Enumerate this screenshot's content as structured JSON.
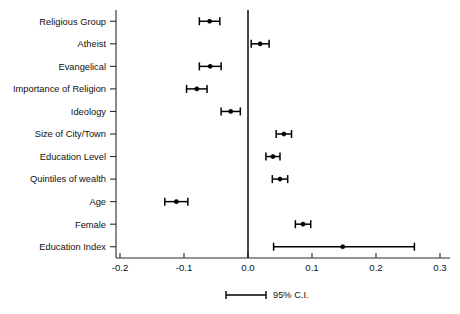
{
  "chart_data": {
    "type": "scatter",
    "title": "",
    "subtitle": "",
    "xlabel": "",
    "ylabel": "",
    "orientation": "horizontal",
    "xlim": [
      -0.2,
      0.3
    ],
    "xticks": [
      -0.2,
      -0.1,
      0.0,
      0.1,
      0.2,
      0.3
    ],
    "xticklabels": [
      "-0.2",
      "-0.1",
      "0.0",
      "0.1",
      "0.2",
      "0.3"
    ],
    "grid": false,
    "zero_reference_line": 0.0,
    "legend": {
      "position": "below-axis-center",
      "entries": [
        {
          "label": "95% C.I.",
          "marker": "error-bar"
        }
      ]
    },
    "categories": [
      "Religious Group",
      "Atheist",
      "Evangelical",
      "Importance of Religion",
      "Ideology",
      "Size of City/Town",
      "Education Level",
      "Quintiles of wealth",
      "Age",
      "Female",
      "Education Index"
    ],
    "values": [
      -0.06,
      0.019,
      -0.059,
      -0.08,
      -0.027,
      0.056,
      0.039,
      0.05,
      -0.112,
      0.086,
      0.148
    ],
    "ci_low": [
      -0.076,
      0.005,
      -0.076,
      -0.096,
      -0.042,
      0.044,
      0.028,
      0.038,
      -0.13,
      0.074,
      0.04
    ],
    "ci_high": [
      -0.044,
      0.033,
      -0.042,
      -0.064,
      -0.012,
      0.068,
      0.05,
      0.062,
      -0.094,
      0.098,
      0.26
    ],
    "points": [
      {
        "label": "Religious Group",
        "value": -0.06,
        "ci_low": -0.076,
        "ci_high": -0.044
      },
      {
        "label": "Atheist",
        "value": 0.019,
        "ci_low": 0.005,
        "ci_high": 0.033
      },
      {
        "label": "Evangelical",
        "value": -0.059,
        "ci_low": -0.076,
        "ci_high": -0.042
      },
      {
        "label": "Importance of Religion",
        "value": -0.08,
        "ci_low": -0.096,
        "ci_high": -0.064
      },
      {
        "label": "Ideology",
        "value": -0.027,
        "ci_low": -0.042,
        "ci_high": -0.012
      },
      {
        "label": "Size of City/Town",
        "value": 0.056,
        "ci_low": 0.044,
        "ci_high": 0.068
      },
      {
        "label": "Education Level",
        "value": 0.039,
        "ci_low": 0.028,
        "ci_high": 0.05
      },
      {
        "label": "Quintiles of wealth",
        "value": 0.05,
        "ci_low": 0.038,
        "ci_high": 0.062
      },
      {
        "label": "Age",
        "value": -0.112,
        "ci_low": -0.13,
        "ci_high": -0.094
      },
      {
        "label": "Female",
        "value": 0.086,
        "ci_low": 0.074,
        "ci_high": 0.098
      },
      {
        "label": "Education Index",
        "value": 0.148,
        "ci_low": 0.04,
        "ci_high": 0.26
      }
    ],
    "colors": {
      "marker": "#000000",
      "error_bar": "#000000",
      "axis": "#2b2b2b",
      "zero_line": "#1a1a1a",
      "background": "#ffffff"
    }
  }
}
